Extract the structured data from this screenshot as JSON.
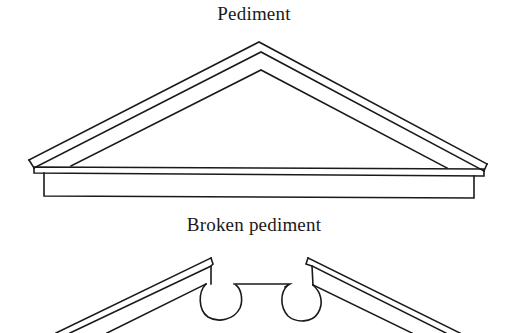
{
  "figures": [
    {
      "id": "pediment",
      "caption": "Pediment",
      "description": "Triangular classical pediment with raking cornice over a horizontal entablature"
    },
    {
      "id": "broken-pediment",
      "caption": "Broken pediment",
      "description": "Pediment whose raking cornices are interrupted at the apex, with scrolled (volute) ends"
    }
  ],
  "colors": {
    "ink": "#1a1a1a",
    "paper": "#ffffff"
  }
}
